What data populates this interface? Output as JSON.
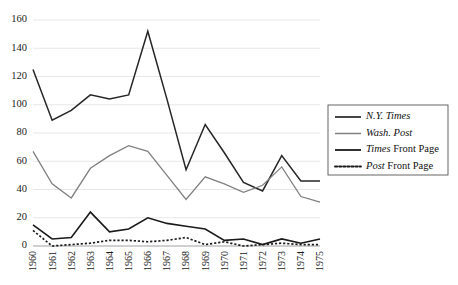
{
  "chart_data": {
    "type": "line",
    "title": "",
    "subtitle": "",
    "xlabel": "",
    "ylabel": "",
    "x": [
      "1960",
      "1961",
      "1962",
      "1963",
      "1964",
      "1965",
      "1966",
      "1967",
      "1968",
      "1969",
      "1970",
      "1971",
      "1972",
      "1973",
      "1974",
      "1975"
    ],
    "categories": [
      "1960",
      "1961",
      "1962",
      "1963",
      "1964",
      "1965",
      "1966",
      "1967",
      "1968",
      "1969",
      "1970",
      "1971",
      "1972",
      "1973",
      "1974",
      "1975"
    ],
    "xlim": [
      0,
      15
    ],
    "ylim": [
      0,
      160
    ],
    "yticks": [
      0,
      20,
      40,
      60,
      80,
      100,
      120,
      140,
      160
    ],
    "ytick_labels": [
      "0",
      "20",
      "40",
      "60",
      "80",
      "100",
      "120",
      "140",
      "160"
    ],
    "grid": true,
    "grid_axis": "y",
    "legend_position": "right-outside",
    "xtick_rotation": 90,
    "series": [
      {
        "name": "N.Y. Times",
        "style": "solid",
        "color": "#262626",
        "width": 1.5,
        "italic": true,
        "values": [
          125,
          89,
          96,
          107,
          104,
          107,
          152,
          104,
          54,
          86,
          66,
          45,
          39,
          64,
          46,
          46
        ]
      },
      {
        "name": "Wash. Post",
        "style": "solid",
        "color": "#808080",
        "width": 1.3,
        "italic": true,
        "values": [
          67,
          44,
          34,
          55,
          64,
          71,
          67,
          50,
          33,
          49,
          44,
          38,
          43,
          56,
          35,
          31
        ]
      },
      {
        "name": "Times Front Page",
        "style": "solid",
        "color": "#1a1a1a",
        "width": 1.6,
        "italic_word": "Times",
        "values": [
          15,
          5,
          6,
          24,
          10,
          12,
          20,
          16,
          14,
          12,
          4,
          5,
          1,
          5,
          2,
          5
        ]
      },
      {
        "name": "Post Front Page",
        "style": "dotted",
        "color": "#1a1a1a",
        "width": 1.7,
        "italic_word": "Post",
        "values": [
          11,
          0,
          1,
          2,
          4,
          4,
          3,
          4,
          6,
          1,
          3,
          0,
          1,
          2,
          1,
          1
        ]
      }
    ]
  },
  "legend": {
    "items": [
      {
        "label": "N.Y. Times",
        "italic_part": "N.Y. Times",
        "plain_part": "",
        "style": "solid",
        "color": "#262626",
        "width": 1.7
      },
      {
        "label": "Wash. Post",
        "italic_part": "Wash. Post",
        "plain_part": "",
        "style": "solid",
        "color": "#808080",
        "width": 1.5
      },
      {
        "label": "Times Front Page",
        "italic_part": "Times",
        "plain_part": " Front Page",
        "style": "solid",
        "color": "#1a1a1a",
        "width": 1.8
      },
      {
        "label": "Post Front Page",
        "italic_part": "Post",
        "plain_part": " Front Page",
        "style": "dotted",
        "color": "#1a1a1a",
        "width": 1.9
      }
    ]
  },
  "colors": {
    "background": "#ffffff",
    "gridline": "#dcdcdc",
    "axis": "#9a9a9a",
    "text": "#1a1a1a",
    "legend_border": "#555555"
  }
}
